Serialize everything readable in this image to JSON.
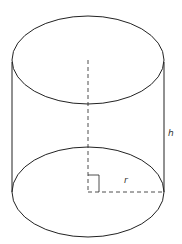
{
  "diagram": {
    "type": "cylinder",
    "labels": {
      "height": "h",
      "radius": "r"
    },
    "colors": {
      "stroke": "#222222",
      "background": "#ffffff"
    }
  }
}
